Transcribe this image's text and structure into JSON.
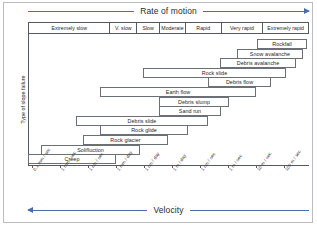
{
  "figure": {
    "top_axis_label": "Rate of motion",
    "bottom_axis_label": "Velocity",
    "y_axis_label": "Type of slope failure",
    "accent_color": "#4a6fa8",
    "frame_color": "#555a60",
    "bar_border_color": "#6b7077"
  },
  "chart_data": {
    "type": "bar",
    "title": "Rate of motion",
    "xlabel": "Velocity",
    "ylabel": "Type of slope failure",
    "orientation": "horizontal-range",
    "grid": false,
    "legend": "none",
    "x_axis": {
      "scale": "logarithmic",
      "tick_labels": [
        "0.1 mm / sec",
        "1 mm / sec",
        "1 cm / sec",
        "1 mm / day",
        "1 cm / day",
        "1 m / day",
        "1 cm / sec",
        "1 m / sec",
        "10 m / sec",
        "100 m / sec"
      ]
    },
    "rate_categories": [
      "Extremely slow",
      "V. slow",
      "Slow",
      "Moderate",
      "Rapid",
      "Very rapid",
      "Extremely rapid"
    ],
    "rate_category_widths": [
      82,
      27,
      23,
      26,
      36,
      42,
      45
    ],
    "bars": [
      {
        "label": "Rockfall",
        "start": 229,
        "end": 279,
        "row": 0
      },
      {
        "label": "Snow avalanche",
        "start": 209,
        "end": 275,
        "row": 1
      },
      {
        "label": "Debris avalanche",
        "start": 192,
        "end": 268,
        "row": 2
      },
      {
        "label": "Rock slide",
        "start": 115,
        "end": 258,
        "row": 3
      },
      {
        "label": "Debris flow",
        "start": 180,
        "end": 243,
        "row": 4
      },
      {
        "label": "Earth flow",
        "start": 72,
        "end": 228,
        "row": 5
      },
      {
        "label": "Debris slump",
        "start": 131,
        "end": 201,
        "row": 6
      },
      {
        "label": "Sand run",
        "start": 131,
        "end": 193,
        "row": 7
      },
      {
        "label": "Debris slide",
        "start": 48,
        "end": 180,
        "row": 8
      },
      {
        "label": "Rock glide",
        "start": 72,
        "end": 160,
        "row": 9
      },
      {
        "label": "Rock glacier",
        "start": 55,
        "end": 140,
        "row": 10
      },
      {
        "label": "Solifluction",
        "start": 13,
        "end": 112,
        "row": 11
      },
      {
        "label": "Creep",
        "start": 0,
        "end": 88,
        "row": 12
      }
    ]
  }
}
